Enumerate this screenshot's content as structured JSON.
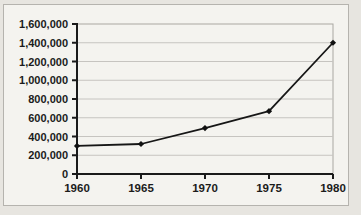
{
  "chart_data": {
    "type": "line",
    "title": "",
    "xlabel": "",
    "ylabel": "",
    "categories": [
      "1960",
      "1965",
      "1970",
      "1975",
      "1980"
    ],
    "values": [
      300000,
      320000,
      490000,
      670000,
      1400000
    ],
    "ylim": [
      0,
      1600000
    ],
    "ytick_step": 200000,
    "ytick_labels": [
      "0",
      "200,000",
      "400,000",
      "600,000",
      "800,000",
      "1,000,000",
      "1,200,000",
      "1,400,000",
      "1,600,000"
    ],
    "grid": true,
    "legend_position": "none",
    "marker": "diamond",
    "colors": {
      "line": "#161616",
      "marker": "#111111",
      "axis": "#1a1a1a",
      "gridline": "#c6c4c0",
      "plot_border": "#a9a7a2",
      "tick_label": "#1b1b1b",
      "plot_background": "#f4f3ef",
      "frame_border": "#b5b3ae"
    }
  }
}
